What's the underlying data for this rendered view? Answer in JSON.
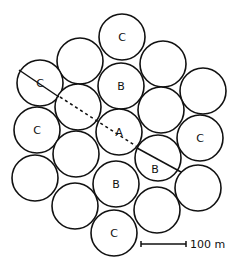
{
  "diagram": {
    "radius": 23,
    "circles": [
      {
        "cx": 122,
        "cy": 37,
        "label": "C"
      },
      {
        "cx": 80,
        "cy": 61,
        "label": ""
      },
      {
        "cx": 163,
        "cy": 64,
        "label": ""
      },
      {
        "cx": 40,
        "cy": 83,
        "label": "C"
      },
      {
        "cx": 121,
        "cy": 86,
        "label": "B"
      },
      {
        "cx": 203,
        "cy": 91,
        "label": ""
      },
      {
        "cx": 78,
        "cy": 107,
        "label": ""
      },
      {
        "cx": 161,
        "cy": 110,
        "label": ""
      },
      {
        "cx": 37,
        "cy": 130,
        "label": "C"
      },
      {
        "cx": 119,
        "cy": 132,
        "label": "A"
      },
      {
        "cx": 200,
        "cy": 138,
        "label": "C"
      },
      {
        "cx": 76,
        "cy": 154,
        "label": ""
      },
      {
        "cx": 158,
        "cy": 158,
        "label": ""
      },
      {
        "cx": 35,
        "cy": 178,
        "label": ""
      },
      {
        "cx": 116,
        "cy": 184,
        "label": "B"
      },
      {
        "cx": 198,
        "cy": 188,
        "label": ""
      },
      {
        "cx": 75,
        "cy": 206,
        "label": ""
      },
      {
        "cx": 157,
        "cy": 210,
        "label": ""
      },
      {
        "cx": 114,
        "cy": 233,
        "label": "C"
      }
    ],
    "extra_labels": [
      {
        "x": 155,
        "y": 169,
        "text": "B"
      }
    ],
    "solid_lines": [
      {
        "x1": 19,
        "y1": 70,
        "x2": 59,
        "y2": 97
      },
      {
        "x1": 137,
        "y1": 148,
        "x2": 181,
        "y2": 172
      }
    ],
    "dashed_line": {
      "x1": 60,
      "y1": 97,
      "x2": 136,
      "y2": 146
    },
    "scale_bar": {
      "x1": 141,
      "x2": 186,
      "y": 244,
      "label": "100 m"
    }
  }
}
